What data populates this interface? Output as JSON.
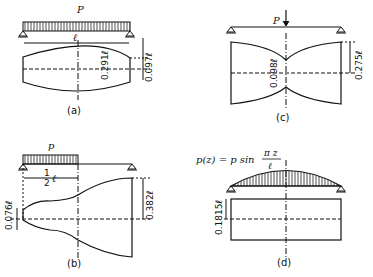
{
  "figures": [
    {
      "id": "a",
      "caption": "(a)",
      "load_label": "P",
      "span_label": "ℓ",
      "dims": [
        "0.291ℓ",
        "0.097ℓ"
      ]
    },
    {
      "id": "b",
      "caption": "(b)",
      "load_label": "p",
      "span_label": "1/2 ℓ",
      "half": "1",
      "half_den": "2",
      "dims": [
        "0.076ℓ",
        "0.382ℓ"
      ]
    },
    {
      "id": "c",
      "caption": "(c)",
      "load_label": "P",
      "dims": [
        "0.098ℓ",
        "0.275ℓ"
      ]
    },
    {
      "id": "d",
      "caption": "(d)",
      "load_label": "p(z) = p sin",
      "frac_num": "π z",
      "frac_den": "ℓ",
      "dims": [
        "0.1815ℓ"
      ]
    }
  ]
}
